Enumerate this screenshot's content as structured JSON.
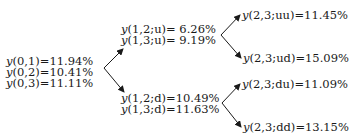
{
  "diagram": {
    "type": "binomial-tree",
    "root": {
      "lines": [
        {
          "fn": "y",
          "args": "(0,1)",
          "value": "=11.94%"
        },
        {
          "fn": "y",
          "args": "(0,2)",
          "value": "=10.41%"
        },
        {
          "fn": "y",
          "args": "(0,3)",
          "value": "=11.11%"
        }
      ]
    },
    "level1": {
      "up": {
        "lines": [
          {
            "fn": "y",
            "args": "(1,2;u)",
            "value": "= 6.26%"
          },
          {
            "fn": "y",
            "args": "(1,3;u)",
            "value": "= 9.19%"
          }
        ]
      },
      "down": {
        "lines": [
          {
            "fn": "y",
            "args": "(1,2;d)",
            "value": "=10.49%"
          },
          {
            "fn": "y",
            "args": "(1,3;d)",
            "value": "=11.63%"
          }
        ]
      }
    },
    "level2": {
      "uu": {
        "fn": "y",
        "args": "(2,3;uu)",
        "value": "=11.45%"
      },
      "ud": {
        "fn": "y",
        "args": "(2,3;ud)",
        "value": "=15.09%"
      },
      "du": {
        "fn": "y",
        "args": "(2,3;du)",
        "value": "=11.09%"
      },
      "dd": {
        "fn": "y",
        "args": "(2,3;dd)",
        "value": "=13.15%"
      }
    },
    "arrow_color": "#1a1a1a"
  }
}
